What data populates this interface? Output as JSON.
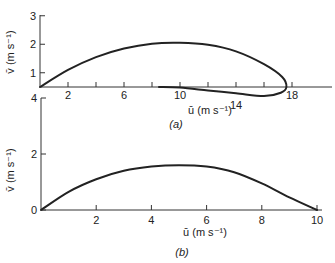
{
  "chart_data": [
    {
      "type": "line",
      "panel_label": "(a)",
      "title": "",
      "xlabel": "ū (m s⁻¹)",
      "ylabel": "v̄ (m s⁻¹)",
      "xlim": [
        0,
        21
      ],
      "ylim": [
        0.5,
        3
      ],
      "x_ticks": [
        2,
        4,
        6,
        8,
        10,
        12,
        14,
        16,
        18
      ],
      "x_tick_labels": [
        "2",
        "",
        "6",
        "",
        "10",
        "",
        "14",
        "",
        "18"
      ],
      "y_ticks": [
        1,
        2,
        3
      ],
      "y_tick_labels": [
        "1",
        "2",
        "3"
      ],
      "grid": false,
      "series": [
        {
          "name": "hodograph-a",
          "x": [
            0,
            2,
            4,
            6,
            8,
            10,
            12,
            14,
            16,
            17.3,
            17.6,
            17.2,
            16,
            14,
            12,
            10,
            8.5
          ],
          "y": [
            0.5,
            1.1,
            1.55,
            1.85,
            2.02,
            2.05,
            1.98,
            1.75,
            1.3,
            0.85,
            0.5,
            0.3,
            0.18,
            0.28,
            0.38,
            0.48,
            0.5
          ]
        }
      ]
    },
    {
      "type": "line",
      "panel_label": "(b)",
      "title": "",
      "xlabel": "ū (m s⁻¹)",
      "ylabel": "v̄ (m s⁻¹)",
      "xlim": [
        0,
        10
      ],
      "ylim": [
        0,
        4
      ],
      "x_ticks": [
        2,
        4,
        6,
        8,
        10
      ],
      "x_tick_labels": [
        "2",
        "4",
        "6",
        "8",
        "10"
      ],
      "y_ticks": [
        0,
        2,
        4
      ],
      "y_tick_labels": [
        "0",
        "2",
        "4"
      ],
      "grid": false,
      "series": [
        {
          "name": "hodograph-b",
          "x": [
            0,
            1,
            2,
            3,
            4,
            5,
            6,
            7,
            8,
            9,
            10
          ],
          "y": [
            0,
            0.65,
            1.1,
            1.4,
            1.55,
            1.6,
            1.55,
            1.35,
            0.95,
            0.45,
            0
          ]
        }
      ]
    }
  ]
}
